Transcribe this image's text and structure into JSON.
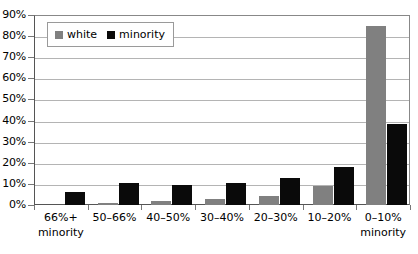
{
  "chart_data": {
    "type": "bar",
    "title": "",
    "subtitle": "",
    "xlabel": "",
    "ylabel": "",
    "categories": [
      {
        "line1": "66%+",
        "line2": "minority"
      },
      {
        "line1": "50–66%",
        "line2": ""
      },
      {
        "line1": "40–50%",
        "line2": ""
      },
      {
        "line1": "30–40%",
        "line2": ""
      },
      {
        "line1": "20–30%",
        "line2": ""
      },
      {
        "line1": "10–20%",
        "line2": ""
      },
      {
        "line1": "0–10%",
        "line2": "minority"
      }
    ],
    "series": [
      {
        "name": "white",
        "color": "#808080",
        "values": [
          0,
          1,
          2,
          3,
          4.5,
          9,
          85
        ]
      },
      {
        "name": "minority",
        "color": "#0a0a0a",
        "values": [
          6,
          10.5,
          9.5,
          10.5,
          13,
          18,
          38.5
        ]
      }
    ],
    "ylim": [
      0,
      90
    ],
    "ytick_values": [
      0,
      10,
      20,
      30,
      40,
      50,
      60,
      70,
      80,
      90
    ],
    "ytick_labels": [
      "0%",
      "10%",
      "20%",
      "30%",
      "40%",
      "50%",
      "60%",
      "70%",
      "80%",
      "90%"
    ],
    "grid": true,
    "grid_axis": "y",
    "legend_position": "top-left",
    "legend_entries": [
      {
        "label": "white",
        "swatch": "#808080"
      },
      {
        "label": "minority",
        "swatch": "#0a0a0a"
      }
    ]
  }
}
